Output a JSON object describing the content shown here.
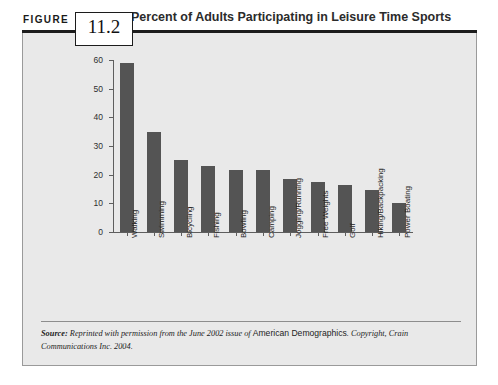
{
  "figure": {
    "label": "FIGURE",
    "number": "11.2",
    "title": "Percent of Adults Participating in Leisure Time Sports"
  },
  "source": {
    "prefix": "Source:",
    "text_before": " Reprinted with permission from the June 2002 issue of ",
    "publication": "American Demographics",
    "text_after": ". Copyright, Crain Communications Inc. 2004."
  },
  "colors": {
    "bar": "#545454",
    "panel_background": "#e9e9e9",
    "header_bar": "#1c1c1c",
    "axis": "#5e5e5e"
  },
  "chart_data": {
    "type": "bar",
    "title": "Percent of Adults Participating in Leisure Time Sports",
    "xlabel": "",
    "ylabel": "",
    "ylim": [
      0,
      60
    ],
    "yticks": [
      0,
      10,
      20,
      30,
      40,
      50,
      60
    ],
    "grid": false,
    "legend": false,
    "categories": [
      "Walking",
      "Swimming",
      "Bicycling",
      "Fishing",
      "Bowling",
      "Camping",
      "Jogging/Running",
      "Free Weights",
      "Golf",
      "Hiking/Backpacking",
      "Power Boating"
    ],
    "values": [
      59,
      35,
      25,
      23,
      21.5,
      21.5,
      18.5,
      17.5,
      16.5,
      14.5,
      10
    ]
  }
}
